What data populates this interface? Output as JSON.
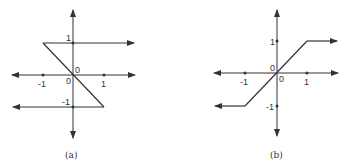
{
  "panels": [
    {
      "caption": "(a)",
      "origin_label_upper": "0",
      "origin_label_lower": "0",
      "x_ticks": {
        "neg": "-1",
        "pos": "1"
      },
      "y_ticks": {
        "pos": "1",
        "neg": "-1"
      },
      "description": "Hysteresis (relay) characteristic: output +1 for x > -1 on upper branch, -1 for x < 1 on lower branch, connected by a negative-slope segment from (-1,1) to (1,-1)"
    },
    {
      "caption": "(b)",
      "origin_label_upper": "0",
      "origin_label_lower": "0",
      "x_ticks": {
        "neg": "-1",
        "pos": "1"
      },
      "y_ticks": {
        "pos": "1",
        "neg": "-1"
      },
      "description": "Saturation characteristic: linear slope 1 from (-1,-1) to (1,1), constant 1 for x > 1, constant -1 for x < -1"
    }
  ],
  "colors": {
    "stroke": "#333333",
    "background": "#ffffff"
  }
}
